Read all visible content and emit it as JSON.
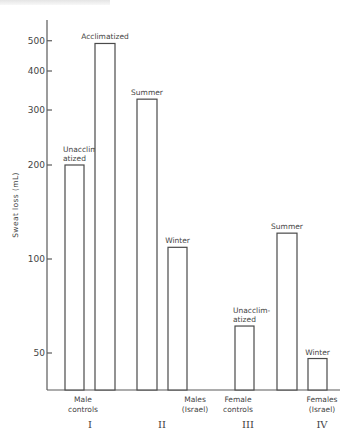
{
  "chart_data": {
    "type": "bar",
    "title": "",
    "xlabel": "",
    "ylabel": "Sweat loss (mL)",
    "yscale": "log",
    "ylim": [
      40,
      600
    ],
    "yticks": [
      50,
      100,
      200,
      300,
      400,
      500
    ],
    "ytick_labels": [
      "50",
      "100",
      "200",
      "300",
      "400",
      "500"
    ],
    "grid": false,
    "legend": null,
    "groups": [
      {
        "numeral": "I",
        "label_lines": [
          "Male",
          "controls"
        ],
        "bars": [
          {
            "label": [
              "Unacclim-",
              "atized"
            ],
            "value": 200
          },
          {
            "label": [
              "Acclimatized"
            ],
            "value": 490
          }
        ]
      },
      {
        "numeral": "II",
        "label_lines": [
          "Males",
          "(Israel)"
        ],
        "bars": [
          {
            "label": [
              "Summer"
            ],
            "value": 325
          },
          {
            "label": [
              "Winter"
            ],
            "value": 109
          }
        ]
      },
      {
        "numeral": "III",
        "label_lines": [
          "Female",
          "controls"
        ],
        "bars": [
          {
            "label": [
              "Unacclim-",
              "atized"
            ],
            "value": 61
          }
        ]
      },
      {
        "numeral": "IV",
        "label_lines": [
          "Females",
          "(Israel)"
        ],
        "bars": [
          {
            "label": [
              "Summer"
            ],
            "value": 121
          },
          {
            "label": [
              "Winter"
            ],
            "value": 48
          }
        ]
      }
    ],
    "categories": [
      "Male controls – Unacclimatized",
      "Male controls – Acclimatized",
      "Males (Israel) – Summer",
      "Males (Israel) – Winter",
      "Female controls – Unacclimatized",
      "Females (Israel) – Summer",
      "Females (Israel) – Winter"
    ],
    "values": [
      200,
      490,
      325,
      109,
      61,
      121,
      48
    ]
  }
}
